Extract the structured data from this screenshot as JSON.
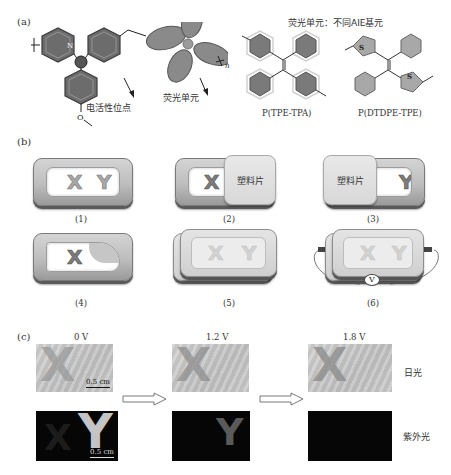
{
  "panel_a": {
    "label": "(a)",
    "polymer": {
      "n_subscript": "n",
      "nitrogen": "N",
      "methoxy": "O",
      "electroactive_site_label": "电活性位点",
      "fluorescent_unit_label": "荧光单元"
    },
    "aie_title": "荧光单元：不同AIE基元",
    "structures": [
      {
        "name": "P(TPE-TPA)"
      },
      {
        "name": "P(DTDPE-TPE)",
        "heteroatom": "S"
      }
    ]
  },
  "panel_b": {
    "label": "(b)",
    "plastic_label": "塑料片",
    "voltmeter": "V",
    "letters": [
      "X",
      "Y"
    ],
    "steps": [
      {
        "id": "(1)"
      },
      {
        "id": "(2)"
      },
      {
        "id": "(3)"
      },
      {
        "id": "(4)"
      },
      {
        "id": "(5)"
      },
      {
        "id": "(6)"
      }
    ]
  },
  "panel_c": {
    "label": "(c)",
    "voltages": [
      "0 V",
      "1.2 V",
      "1.8 V"
    ],
    "row_labels": {
      "daylight": "日光",
      "uv": "紫外光"
    },
    "scale_bar": "0.5 cm",
    "photo_letters": {
      "daylight": "X",
      "uv": "Y"
    }
  }
}
